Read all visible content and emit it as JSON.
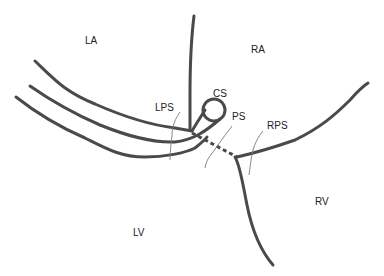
{
  "diagram": {
    "type": "cardiac anatomy schematic",
    "labels": {
      "la": "LA",
      "ra": "RA",
      "lv": "LV",
      "rv": "RV",
      "cs": "CS",
      "ps": "PS",
      "lps": "LPS",
      "rps": "RPS"
    },
    "colors": {
      "line": "#4a4a4a",
      "leader": "#7a7a7a",
      "background": "#ffffff"
    }
  }
}
